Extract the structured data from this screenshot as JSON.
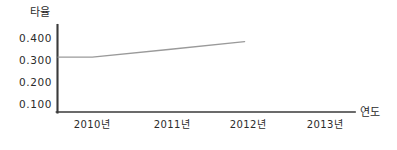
{
  "chart_data": {
    "type": "line",
    "title": "",
    "xlabel": "연도",
    "ylabel": "타율",
    "categories": [
      "2010년",
      "2011년",
      "2012년",
      "2013년"
    ],
    "x": [
      2010,
      2011,
      2012,
      2013
    ],
    "series": [
      {
        "name": "타율",
        "values": [
          0.287,
          0.327,
          0.368,
          null
        ]
      }
    ],
    "ytick_labels": [
      "0.400",
      "0.300",
      "0.200",
      "0.100"
    ],
    "ytick_values": [
      0.4,
      0.3,
      0.2,
      0.1
    ],
    "ylim": [
      0.0,
      0.455
    ],
    "xlim": [
      2009.55,
      2013.45
    ],
    "grid": false,
    "legend": false,
    "line_color": "#9a9a9a",
    "axis_color": "#3a3a3a",
    "text_color": "#2b2b2b",
    "annotations": [
      "line is flat near 0.287 before the 2010 tick, then rises steadily",
      "line terminates shortly after the 2012 tick and does not reach 2013"
    ]
  },
  "axes": {
    "y_title": "타율",
    "x_title": "연도"
  }
}
